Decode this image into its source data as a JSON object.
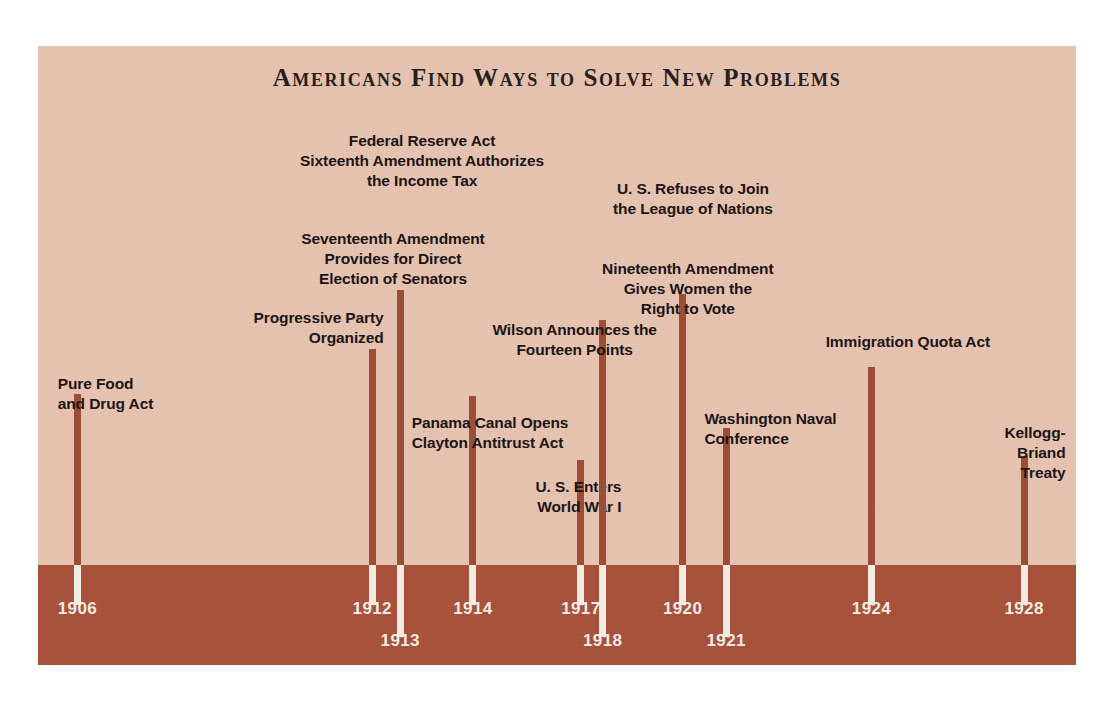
{
  "poster": {
    "title": "Americans Find Ways to Solve New Problems",
    "background_color": "#e8c3b0",
    "band_color": "#a84f38",
    "bar_color": "#9c4a33",
    "bar_tip_color": "#f6efe6",
    "text_color": "#17100d",
    "year_text_color": "#f7f0e7"
  },
  "chart_data": {
    "type": "timeline",
    "title": "Americans Find Ways to Solve New Problems",
    "xlabel": "",
    "ylabel": "",
    "xlim": [
      1905,
      1929
    ],
    "grid": false,
    "legend": null,
    "categories": [
      "1906",
      "1912",
      "1913",
      "1914",
      "1917",
      "1918",
      "1920",
      "1921",
      "1924",
      "1928"
    ],
    "events": [
      {
        "year": "1906",
        "label": "Pure Food\nand Drug Act",
        "x_pct": 3.8,
        "bar_top_pct": 56.2,
        "align": "l",
        "caption_x_pct": 1.9,
        "caption_y_pct": 53.0,
        "year_row": 1
      },
      {
        "year": "1912",
        "label": "Progressive Party\nOrganized",
        "x_pct": 32.2,
        "bar_top_pct": 48.9,
        "align": "r",
        "caption_x_pct": 33.3,
        "caption_y_pct": 42.3,
        "year_row": 1
      },
      {
        "year": "1913",
        "label": "Federal Reserve Act\nSixteenth Amendment Authorizes\nthe Income Tax",
        "label2": "Seventeenth Amendment\nProvides for Direct\nElection of Senators",
        "x_pct": 34.9,
        "bar_top_pct": 39.4,
        "align": "c",
        "caption_x_pct": 37.0,
        "caption_y_pct": 13.7,
        "caption2_x_pct": 34.2,
        "caption2_y_pct": 29.6,
        "year_row": 2
      },
      {
        "year": "1914",
        "label": "Panama Canal Opens\nClayton Antitrust Act",
        "x_pct": 41.9,
        "bar_top_pct": 56.5,
        "align": "l",
        "caption_x_pct": 36.0,
        "caption_y_pct": 59.3,
        "year_row": 1
      },
      {
        "year": "1917",
        "label": "U. S. Enters\nWorld War I",
        "x_pct": 52.3,
        "bar_top_pct": 66.9,
        "align": "r",
        "caption_x_pct": 56.2,
        "caption_y_pct": 69.6,
        "year_row": 1
      },
      {
        "year": "1918",
        "label": "Wilson Announces the\nFourteen Points",
        "x_pct": 54.4,
        "bar_top_pct": 44.3,
        "align": "c",
        "caption_x_pct": 51.7,
        "caption_y_pct": 44.3,
        "year_row": 2
      },
      {
        "year": "1920",
        "label": "U. S. Refuses to Join\nthe League of Nations",
        "label2": "Nineteenth Amendment\nGives Women the\nRight to Vote",
        "x_pct": 62.1,
        "bar_top_pct": 40.1,
        "align": "c",
        "caption_x_pct": 63.1,
        "caption_y_pct": 21.5,
        "caption2_x_pct": 62.6,
        "caption2_y_pct": 34.4,
        "year_row": 1
      },
      {
        "year": "1921",
        "label": "Washington Naval\nConference",
        "x_pct": 66.3,
        "bar_top_pct": 61.7,
        "align": "l",
        "caption_x_pct": 64.2,
        "caption_y_pct": 58.6,
        "year_row": 2
      },
      {
        "year": "1924",
        "label": "Immigration Quota Act",
        "x_pct": 80.3,
        "bar_top_pct": 51.9,
        "align": "c",
        "caption_x_pct": 83.8,
        "caption_y_pct": 46.2,
        "year_row": 1
      },
      {
        "year": "1928",
        "label": "Kellogg-Briand\nTreaty",
        "x_pct": 95.0,
        "bar_top_pct": 66.2,
        "align": "r",
        "caption_x_pct": 99.0,
        "caption_y_pct": 60.9,
        "year_row": 1
      }
    ]
  }
}
